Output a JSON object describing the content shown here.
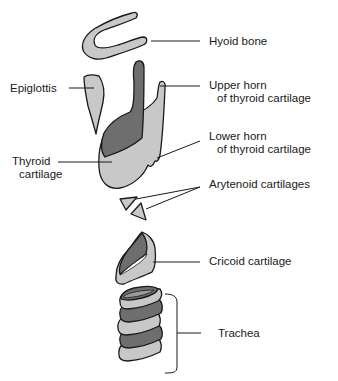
{
  "diagram": {
    "colors": {
      "light_cartilage": "#c8c8c8",
      "dark_cartilage": "#6e6e6e",
      "outline": "#1a1a1a",
      "background": "#ffffff"
    },
    "labels": {
      "hyoid": "Hyoid bone",
      "epiglottis": "Epiglottis",
      "upper_horn_1": "Upper horn",
      "upper_horn_2": "of thyroid cartilage",
      "lower_horn_1": "Lower horn",
      "lower_horn_2": "of thyroid cartilage",
      "thyroid_1": "Thyroid",
      "thyroid_2": "cartilage",
      "arytenoid": "Arytenoid cartilages",
      "cricoid": "Cricoid cartilage",
      "trachea": "Trachea"
    }
  }
}
